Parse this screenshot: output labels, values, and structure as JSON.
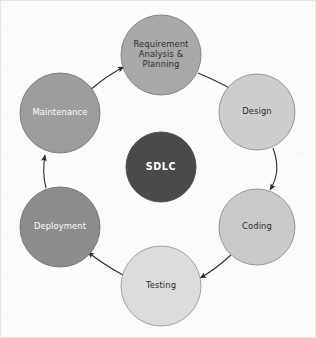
{
  "diagram": {
    "title": "SDLC",
    "hub": {
      "label": "SDLC",
      "fill": "#4a4a4a",
      "text_color": "#ffffff",
      "cx": 160,
      "cy": 166,
      "r": 35
    },
    "background_color": "#fbfbf9",
    "arrow_color": "#2d2d2d",
    "stages": [
      {
        "id": "requirement-analysis-planning",
        "label_lines": [
          "Requirement",
          "Analysis &",
          "Planning"
        ],
        "fill": "#a9a9a9",
        "stroke": "#7d7d7d",
        "text_color": "#2b2b2b",
        "cx": 160,
        "cy": 54,
        "r": 40,
        "order": 1
      },
      {
        "id": "design",
        "label_lines": [
          "Design"
        ],
        "fill": "#cdcdcd",
        "stroke": "#8c8c8c",
        "text_color": "#2b2b2b",
        "cx": 256,
        "cy": 111,
        "r": 38,
        "order": 2
      },
      {
        "id": "coding",
        "label_lines": [
          "Coding"
        ],
        "fill": "#cacaca",
        "stroke": "#8c8c8c",
        "text_color": "#2b2b2b",
        "cx": 256,
        "cy": 226,
        "r": 38,
        "order": 3
      },
      {
        "id": "testing",
        "label_lines": [
          "Testing"
        ],
        "fill": "#dcdcdc",
        "stroke": "#9a9a9a",
        "text_color": "#2b2b2b",
        "cx": 160,
        "cy": 285,
        "r": 40,
        "order": 4
      },
      {
        "id": "deployment",
        "label_lines": [
          "Deployment"
        ],
        "fill": "#8c8c8c",
        "stroke": "#6e6e6e",
        "text_color": "#ffffff",
        "cx": 59,
        "cy": 226,
        "r": 40,
        "order": 5
      },
      {
        "id": "maintenance",
        "label_lines": [
          "Maintenance"
        ],
        "fill": "#9d9d9d",
        "stroke": "#777777",
        "text_color": "#ffffff",
        "cx": 59,
        "cy": 112,
        "r": 40,
        "order": 6
      }
    ],
    "connectors": [
      {
        "id": "requirement-to-design",
        "from": "requirement-analysis-planning",
        "to": "design",
        "path": "M 197 72 C 216 80, 228 86, 240 94"
      },
      {
        "id": "design-to-coding",
        "from": "design",
        "to": "coding",
        "path": "M 272 147 C 278 164, 277 176, 269 189"
      },
      {
        "id": "coding-to-testing",
        "from": "coding",
        "to": "testing",
        "path": "M 230 254 C 219 264, 210 271, 199 277"
      },
      {
        "id": "testing-to-deployment",
        "from": "testing",
        "to": "deployment",
        "path": "M 122 274 C 109 267, 98 260, 87 251"
      },
      {
        "id": "deployment-to-maintenance",
        "from": "deployment",
        "to": "maintenance",
        "path": "M 45 187 C 42 175, 42 165, 44 154"
      },
      {
        "id": "maintenance-to-requirement",
        "from": "maintenance",
        "to": "requirement-analysis-planning",
        "path": "M 89 89 C 101 79, 110 72, 123 66"
      }
    ]
  }
}
